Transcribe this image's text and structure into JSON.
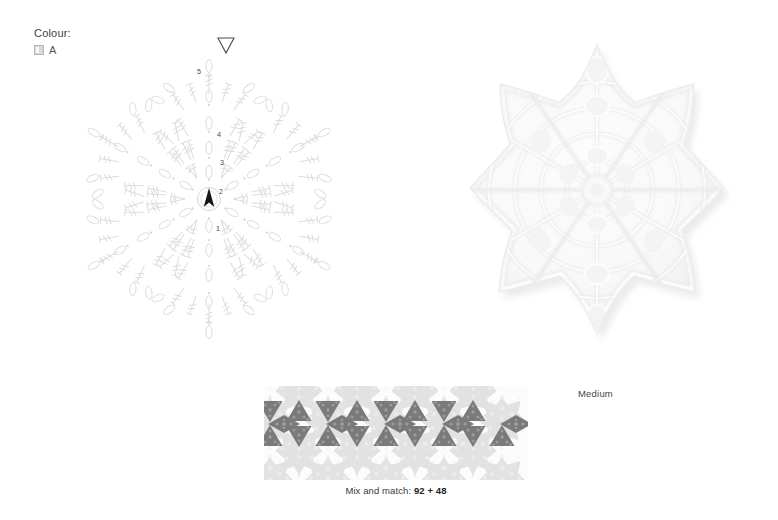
{
  "page": {
    "background_color": "#ffffff"
  },
  "colour_key": {
    "title": "Colour:",
    "entries": [
      {
        "label": "A",
        "swatch_color": "#d9d9d9"
      }
    ]
  },
  "chart": {
    "name": "hexagon-star-crochet-chart",
    "line_color": "#dcdcdc",
    "label_color": "#4c4c4c",
    "round_labels": [
      "1",
      "2",
      "3",
      "4",
      "5"
    ],
    "start_marker": {
      "name": "start-triangle-filled",
      "glyph": "▲",
      "color": "#1a1a1a"
    },
    "end_marker": {
      "name": "end-triangle-open",
      "glyph": "▽",
      "color": "#3a3a3a"
    },
    "symmetry": 6
  },
  "photo": {
    "name": "crochet-star-motif-photo",
    "caption": "Medium",
    "yarn_color": "#ffffff",
    "shadow_color": "#e8e8e8"
  },
  "mix_and_match": {
    "caption_prefix": "Mix and match: ",
    "caption_value": "92 + 48",
    "motif_color": "#e2e2e2",
    "filler_color": "#7d7d7d",
    "repeat_count": 4
  }
}
